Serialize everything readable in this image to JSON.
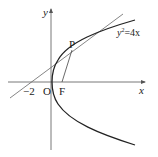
{
  "diagram": {
    "type": "coordinate-geometry",
    "curve_label": "y²=4x",
    "curve_label_base": "y",
    "curve_label_exp": "2",
    "curve_label_rest": "=4x",
    "axis_x_label": "x",
    "axis_y_label": "y",
    "origin_label": "O",
    "point_p_label": "P",
    "focus_label": "F",
    "intercept_label": "−2",
    "colors": {
      "axis": "#555555",
      "curve": "#222222",
      "tangent": "#666666",
      "segment": "#444444",
      "text": "#222222"
    }
  }
}
